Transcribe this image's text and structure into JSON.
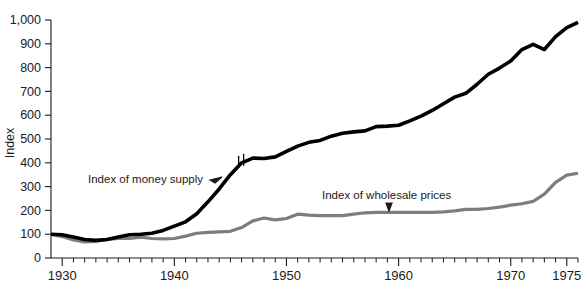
{
  "chart_data": {
    "type": "line",
    "title": "",
    "subtitle": "",
    "xlabel": "",
    "ylabel": "Index",
    "xlim": [
      1929,
      1976
    ],
    "ylim": [
      0,
      1000
    ],
    "grid": false,
    "legend_position": "inline-annotations",
    "y_ticks": [
      0,
      100,
      200,
      300,
      400,
      500,
      600,
      700,
      800,
      900,
      1000
    ],
    "y_tick_labels": [
      "0",
      "100",
      "200",
      "300",
      "400",
      "500",
      "600",
      "700",
      "800",
      "900",
      "1,000"
    ],
    "x_ticks": [
      1930,
      1931,
      1932,
      1933,
      1934,
      1935,
      1936,
      1937,
      1938,
      1939,
      1940,
      1941,
      1942,
      1943,
      1944,
      1945,
      1946,
      1947,
      1948,
      1949,
      1950,
      1951,
      1952,
      1953,
      1954,
      1955,
      1956,
      1957,
      1958,
      1959,
      1960,
      1961,
      1962,
      1963,
      1964,
      1965,
      1966,
      1967,
      1968,
      1969,
      1970,
      1971,
      1972,
      1973,
      1974,
      1975,
      1976
    ],
    "x_major_ticks": [
      1930,
      1940,
      1950,
      1960,
      1970,
      1975
    ],
    "x_tick_labels": [
      "1930",
      "1940",
      "1950",
      "1960",
      "1970",
      "1975"
    ],
    "series": [
      {
        "name": "Index of money supply",
        "color": "#000000",
        "annotation": "Index of money supply",
        "annotation_arrow": "right",
        "break_at_x": 1946,
        "x": [
          1929,
          1930,
          1931,
          1932,
          1933,
          1934,
          1935,
          1936,
          1937,
          1938,
          1939,
          1940,
          1941,
          1942,
          1943,
          1944,
          1945,
          1946,
          1947,
          1948,
          1949,
          1950,
          1951,
          1952,
          1953,
          1954,
          1955,
          1956,
          1957,
          1958,
          1959,
          1960,
          1961,
          1962,
          1963,
          1964,
          1965,
          1966,
          1967,
          1968,
          1969,
          1970,
          1971,
          1972,
          1973,
          1974,
          1975,
          1976
        ],
        "values": [
          100,
          98,
          88,
          78,
          74,
          78,
          88,
          98,
          100,
          104,
          116,
          134,
          152,
          186,
          236,
          290,
          350,
          400,
          420,
          418,
          425,
          448,
          470,
          486,
          494,
          512,
          524,
          530,
          534,
          552,
          554,
          558,
          576,
          596,
          620,
          648,
          676,
          692,
          730,
          772,
          798,
          828,
          876,
          898,
          876,
          930,
          968,
          990
        ]
      },
      {
        "name": "Index of wholesale prices",
        "color": "#7d7d7d",
        "annotation": "Index of wholesale prices",
        "annotation_arrow": "down",
        "x": [
          1929,
          1930,
          1931,
          1932,
          1933,
          1934,
          1935,
          1936,
          1937,
          1938,
          1939,
          1940,
          1941,
          1942,
          1943,
          1944,
          1945,
          1946,
          1947,
          1948,
          1949,
          1950,
          1951,
          1952,
          1953,
          1954,
          1955,
          1956,
          1957,
          1958,
          1959,
          1960,
          1961,
          1962,
          1963,
          1964,
          1965,
          1966,
          1967,
          1968,
          1969,
          1970,
          1971,
          1972,
          1973,
          1974,
          1975,
          1976
        ],
        "values": [
          100,
          90,
          76,
          68,
          70,
          78,
          82,
          82,
          88,
          82,
          80,
          82,
          92,
          104,
          108,
          110,
          112,
          128,
          156,
          168,
          160,
          166,
          184,
          180,
          178,
          178,
          178,
          184,
          190,
          192,
          192,
          192,
          192,
          192,
          192,
          194,
          198,
          204,
          204,
          208,
          214,
          222,
          228,
          238,
          268,
          318,
          348,
          356
        ]
      }
    ]
  },
  "annotations": {
    "money_supply_label": "Index of money supply",
    "wholesale_prices_label": "Index of wholesale prices"
  },
  "axes": {
    "y_axis_title": "Index"
  },
  "colors": {
    "money_supply": "#000000",
    "wholesale_prices": "#7d7d7d",
    "axis": "#1a1a1a",
    "background": "#ffffff"
  }
}
